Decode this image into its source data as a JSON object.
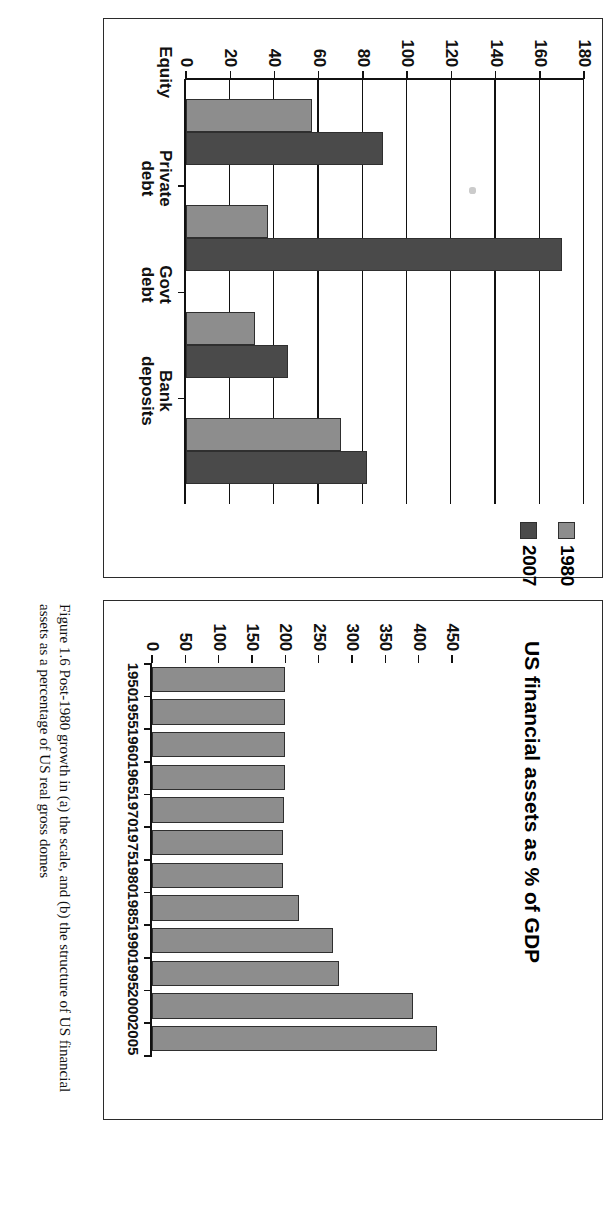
{
  "figure": {
    "caption": "Figure 1.6  Post-1980 growth in (a) the scale, and (b) the structure of US financial assets as a percentage of US real gross domes"
  },
  "panel_a": {
    "name": "US financial assets as % of GDP",
    "title": "US financial assets as % of GDP"
  },
  "panel_b": {
    "legend": [
      {
        "label": "1980",
        "color": "#8d8d8d"
      },
      {
        "label": "2007",
        "color": "#4a4a4a"
      }
    ]
  },
  "chart_data": [
    {
      "type": "bar",
      "orientation": "vertical",
      "title": "US financial assets as % of GDP",
      "xlabel": "",
      "ylabel": "",
      "ylim": [
        0,
        450
      ],
      "yticks": [
        0,
        50,
        100,
        150,
        200,
        250,
        300,
        350,
        400,
        450
      ],
      "grid": false,
      "categories": [
        "1950",
        "1955",
        "1960",
        "1965",
        "1970",
        "1975",
        "1980",
        "1985",
        "1990",
        "1995",
        "2000",
        "2005"
      ],
      "values": [
        200,
        200,
        200,
        200,
        198,
        196,
        196,
        220,
        272,
        281,
        391,
        428
      ],
      "series_color": "#8d8d8d",
      "legend": "none"
    },
    {
      "type": "bar",
      "orientation": "vertical",
      "title": "",
      "xlabel": "",
      "ylabel": "",
      "ylim": [
        0,
        180
      ],
      "yticks": [
        0,
        20,
        40,
        60,
        80,
        100,
        120,
        140,
        160,
        180
      ],
      "grid": true,
      "categories": [
        "Equity",
        "Private debt",
        "Govt debt",
        "Bank deposits"
      ],
      "series": [
        {
          "name": "1980",
          "values": [
            57,
            37,
            31,
            70
          ],
          "color": "#8d8d8d"
        },
        {
          "name": "2007",
          "values": [
            89,
            170,
            46,
            82
          ],
          "color": "#4a4a4a"
        }
      ],
      "legend": "top-right"
    }
  ],
  "ticks_a": {
    "labels": [
      "450",
      "400",
      "350",
      "300",
      "250",
      "200",
      "150",
      "100",
      "50",
      "0"
    ]
  },
  "ticks_b": {
    "labels": [
      "180",
      "160",
      "140",
      "120",
      "100",
      "80",
      "60",
      "40",
      "20",
      "0"
    ]
  },
  "cats_a": [
    "1950",
    "1955",
    "1960",
    "1965",
    "1970",
    "1975",
    "1980",
    "1985",
    "1990",
    "1995",
    "2000",
    "2005"
  ],
  "cats_b": [
    {
      "l1": "Equity",
      "l2": ""
    },
    {
      "l1": "Private",
      "l2": "debt"
    },
    {
      "l1": "Govt",
      "l2": "debt"
    },
    {
      "l1": "Bank",
      "l2": "deposits"
    }
  ]
}
